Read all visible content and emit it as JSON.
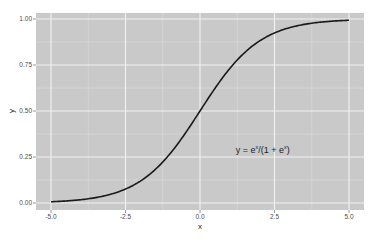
{
  "chart_data": {
    "type": "line",
    "title": "",
    "xlabel": "x",
    "ylabel": "y",
    "xlim": [
      -5.0,
      5.0
    ],
    "ylim": [
      0.0,
      1.0
    ],
    "x_ticks": [
      "-5.0",
      "-2.5",
      "0.0",
      "2.5",
      "5.0"
    ],
    "y_ticks": [
      "0.00",
      "0.25",
      "0.50",
      "0.75",
      "1.00"
    ],
    "grid": true,
    "legend": null,
    "annotation": {
      "text": "y = e^x/(1+e^x)",
      "parts": {
        "lhs": "y = e",
        "sup1": "x",
        "mid": "/(1 + e",
        "sup2": "x",
        "rhs": ")"
      },
      "x": 1.2,
      "y": 0.27
    },
    "series": [
      {
        "name": "logistic",
        "function": "e^x/(1+e^x)",
        "color": "#1a1a1a",
        "x": [
          -5.0,
          -4.0,
          -3.0,
          -2.5,
          -2.0,
          -1.5,
          -1.0,
          -0.5,
          0.0,
          0.5,
          1.0,
          1.5,
          2.0,
          2.5,
          3.0,
          4.0,
          5.0
        ],
        "y": [
          0.0067,
          0.018,
          0.047,
          0.076,
          0.119,
          0.182,
          0.269,
          0.378,
          0.5,
          0.622,
          0.731,
          0.818,
          0.881,
          0.924,
          0.953,
          0.982,
          0.9933
        ]
      }
    ]
  },
  "style": {
    "panel_bg": "#c9c9c9",
    "major_grid": "#f2f2f2",
    "minor_grid": "#dcdcdc",
    "line_color": "#1a1a1a"
  }
}
